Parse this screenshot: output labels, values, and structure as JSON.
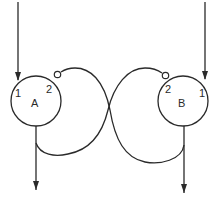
{
  "diagram": {
    "stroke_color": "#2a2a2a",
    "background": "#ffffff",
    "nodes": [
      {
        "id": "A",
        "label": "A",
        "port_1": "1",
        "port_2": "2",
        "cx": 36,
        "cy": 101,
        "r": 25
      },
      {
        "id": "B",
        "label": "B",
        "port_1": "1",
        "port_2": "2",
        "cx": 183,
        "cy": 101,
        "r": 25
      }
    ],
    "connections": [
      {
        "from": "external-input",
        "to": "A.1",
        "type": "excitatory-arrow"
      },
      {
        "from": "external-input",
        "to": "B.1",
        "type": "excitatory-arrow"
      },
      {
        "from": "A.output",
        "to": "B.2",
        "type": "inhibitory-circle"
      },
      {
        "from": "B.output",
        "to": "A.2",
        "type": "inhibitory-circle"
      },
      {
        "from": "A.output",
        "to": "external-output",
        "type": "arrow"
      },
      {
        "from": "B.output",
        "to": "external-output",
        "type": "arrow"
      }
    ]
  }
}
